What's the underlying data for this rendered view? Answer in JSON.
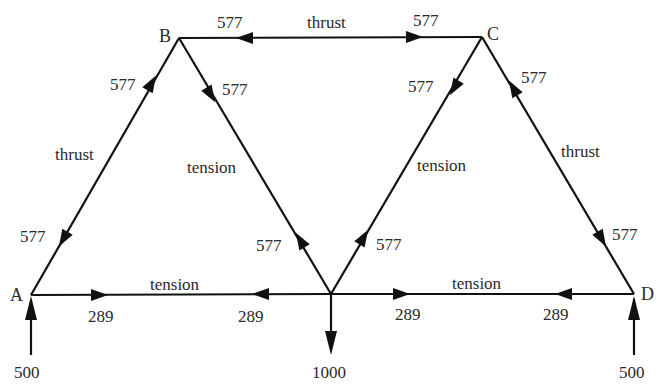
{
  "diagram": {
    "type": "truss-force-diagram",
    "nodes": {
      "A": {
        "label": "A"
      },
      "B": {
        "label": "B"
      },
      "C": {
        "label": "C"
      },
      "D": {
        "label": "D"
      }
    },
    "members": [
      {
        "id": "AB",
        "type_label": "thrust",
        "end_forces": [
          "577",
          "577"
        ]
      },
      {
        "id": "BC",
        "type_label": "thrust",
        "end_forces": [
          "577",
          "577"
        ]
      },
      {
        "id": "CD",
        "type_label": "thrust",
        "end_forces": [
          "577",
          "577"
        ]
      },
      {
        "id": "BM",
        "type_label": "tension",
        "end_forces": [
          "577",
          "577"
        ]
      },
      {
        "id": "CM",
        "type_label": "tension",
        "end_forces": [
          "577",
          "577"
        ]
      },
      {
        "id": "AM",
        "type_label": "tension",
        "end_forces": [
          "289",
          "289"
        ]
      },
      {
        "id": "MD",
        "type_label": "tension",
        "end_forces": [
          "289",
          "289"
        ]
      }
    ],
    "loads": {
      "A_reaction": "500",
      "D_reaction": "500",
      "M_load": "1000"
    },
    "colors": {
      "line": "#111111",
      "text": "#2a2a2a",
      "background": "#ffffff"
    }
  }
}
